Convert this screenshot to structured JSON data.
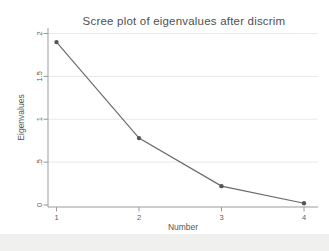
{
  "chart_data": {
    "type": "line",
    "title": "Scree plot of eigenvalues after discrim",
    "xlabel": "Number",
    "ylabel": "Eigenvalues",
    "x": [
      1,
      2,
      3,
      4
    ],
    "y": [
      1.9,
      0.78,
      0.22,
      0.02
    ],
    "series_name": "Eigenvalues",
    "xlim": [
      1,
      4
    ],
    "ylim": [
      0,
      2
    ],
    "xticks": {
      "values": [
        1,
        2,
        3,
        4
      ],
      "labels": [
        "1",
        "2",
        "3",
        "4"
      ]
    },
    "yticks": {
      "values": [
        0,
        0.5,
        1,
        1.5,
        2
      ],
      "labels": [
        "0",
        ".5",
        "1",
        "1.5",
        "2"
      ]
    },
    "grid": "horizontal-y",
    "legend": "none",
    "marker": "filled-circle",
    "colors": {
      "line": "#6a6a6a",
      "marker": "#555555",
      "axis": "#9b9b9b",
      "grid": "#e9e9e7",
      "tick_text": "#5a5a5a",
      "label_text": "#555555",
      "title_text": "#4f4f4f",
      "plot_background": "#ffffff",
      "page_margin": "#f0f0ee"
    }
  }
}
